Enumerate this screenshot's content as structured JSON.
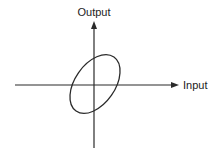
{
  "diagram": {
    "axes": {
      "x_label": "Input",
      "y_label": "Output"
    },
    "curve": {
      "shape": "ellipse",
      "description": "Tilted closed loop centered at origin, major axis inclined positively"
    },
    "colors": {
      "line": "#2a2a2a",
      "text": "#222222",
      "background": "#ffffff"
    }
  }
}
